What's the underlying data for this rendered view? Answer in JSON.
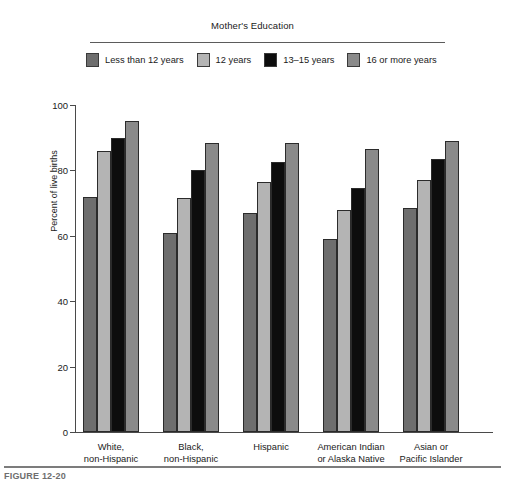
{
  "legend": {
    "title": "Mother's Education",
    "items": [
      {
        "label": "Less than 12 years",
        "color": "#6e6e6e"
      },
      {
        "label": "12 years",
        "color": "#b4b4b4"
      },
      {
        "label": "13–15 years",
        "color": "#0d0d0d"
      },
      {
        "label": "16 or more years",
        "color": "#8a8a8a"
      }
    ]
  },
  "axes": {
    "ylabel": "Percent of live births",
    "yticks": [
      "0",
      "20",
      "40",
      "60",
      "80",
      "100"
    ]
  },
  "caption": {
    "text": "FIGURE 12-20"
  },
  "chart_data": {
    "type": "bar",
    "title": "",
    "subtitle": "",
    "xlabel": "",
    "ylabel": "Percent of live births",
    "ylim": [
      0,
      100
    ],
    "yticks": [
      0,
      20,
      40,
      60,
      80,
      100
    ],
    "grid": false,
    "legend_title": "Mother's Education",
    "legend_position": "top",
    "categories": [
      "White,\nnon-Hispanic",
      "Black,\nnon-Hispanic",
      "Hispanic",
      "American Indian\nor Alaska Native",
      "Asian or\nPacific Islander"
    ],
    "category_lines": [
      [
        "White,",
        "non-Hispanic"
      ],
      [
        "Black,",
        "non-Hispanic"
      ],
      [
        "Hispanic",
        ""
      ],
      [
        "American Indian",
        "or Alaska Native"
      ],
      [
        "Asian or",
        "Pacific Islander"
      ]
    ],
    "series": [
      {
        "name": "Less than 12 years",
        "color": "#6e6e6e",
        "values": [
          72,
          61,
          67,
          59,
          68.5
        ]
      },
      {
        "name": "12 years",
        "color": "#b4b4b4",
        "values": [
          86,
          71.5,
          76.5,
          68,
          77
        ]
      },
      {
        "name": "13–15 years",
        "color": "#0d0d0d",
        "values": [
          90,
          80,
          82.5,
          74.5,
          83.5
        ]
      },
      {
        "name": "16 or more years",
        "color": "#8a8a8a",
        "values": [
          95,
          88.5,
          88.5,
          86.5,
          89
        ]
      }
    ]
  }
}
